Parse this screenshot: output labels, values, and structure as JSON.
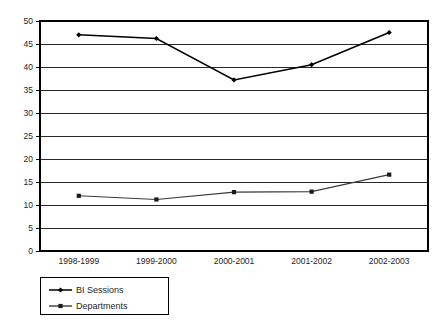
{
  "chart_data": {
    "type": "line",
    "title": "",
    "subtitle": "",
    "xlabel": "",
    "ylabel": "",
    "categories": [
      "1998-1999",
      "1999-2000",
      "2000-2001",
      "2001-2002",
      "2002-2003"
    ],
    "series": [
      {
        "name": "BI Sessions",
        "marker": "diamond",
        "values": [
          47,
          46.2,
          37.2,
          40.5,
          47.5
        ]
      },
      {
        "name": "Departments",
        "marker": "square",
        "values": [
          12,
          11.2,
          12.8,
          12.9,
          16.6
        ]
      }
    ],
    "ylim": [
      0,
      50
    ],
    "ytick_step": 5,
    "yticks": [
      0,
      5,
      10,
      15,
      20,
      25,
      30,
      35,
      40,
      45,
      50
    ],
    "ytick_labels": [
      "0",
      "5",
      "10",
      "15",
      "20",
      "25",
      "30",
      "35",
      "40",
      "45",
      "50"
    ],
    "grid": {
      "horizontal": true,
      "vertical": false,
      "color": "#111111"
    },
    "legend": {
      "position": "bottom-left",
      "entries": [
        {
          "label": "BI Sessions",
          "marker": "diamond",
          "color": "#000000"
        },
        {
          "label": "Departments",
          "marker": "square",
          "color": "#1a1a1a"
        }
      ]
    },
    "colors": {
      "background": "#ffffff",
      "axis": "#000000",
      "grid": "#111111",
      "series_primary": "#000000",
      "series_secondary": "#3a3a3a",
      "text": "#1d1d1d"
    },
    "plot_area": {
      "x": 40,
      "y": 21,
      "width": 388,
      "height": 230
    }
  }
}
